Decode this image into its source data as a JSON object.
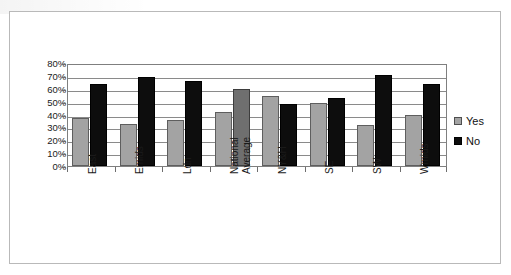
{
  "chart_data": {
    "type": "bar",
    "title": "",
    "subtitle": "",
    "xlabel": "",
    "ylabel": "",
    "ylim": [
      0,
      80
    ],
    "y_tick_labels": [
      "0%",
      "10%",
      "20%",
      "30%",
      "40%",
      "50%",
      "60%",
      "70%",
      "80%"
    ],
    "y_tick_values": [
      0,
      10,
      20,
      30,
      40,
      50,
      60,
      70,
      80
    ],
    "grid": true,
    "grid_axis": "y",
    "legend_position": "right",
    "categories": [
      "East",
      "Emids",
      "Ldn",
      "National Average",
      "NY&H",
      "SE",
      "SW",
      "Wmids"
    ],
    "series": [
      {
        "name": "Yes",
        "color": "#a3a3a3",
        "values": [
          37,
          33,
          36,
          42,
          54,
          49,
          32,
          40
        ]
      },
      {
        "name": "No",
        "color": "#0d0d0d",
        "values": [
          64,
          69,
          66,
          60,
          48,
          53,
          71,
          64
        ]
      }
    ]
  },
  "legend": {
    "entries": [
      {
        "label": "Yes",
        "swatch": "gray-square-swatch"
      },
      {
        "label": "No",
        "swatch": "black-square-swatch"
      }
    ]
  },
  "axis": {
    "y_labels": [
      "80%",
      "70%",
      "60%",
      "50%",
      "40%",
      "30%",
      "20%",
      "10%",
      "0%"
    ],
    "x_labels": [
      {
        "line1": "East",
        "line2": ""
      },
      {
        "line1": "Emids",
        "line2": ""
      },
      {
        "line1": "Ldn",
        "line2": ""
      },
      {
        "line1": "National",
        "line2": "Average"
      },
      {
        "line1": "NY&H",
        "line2": ""
      },
      {
        "line1": "SE",
        "line2": ""
      },
      {
        "line1": "SW",
        "line2": ""
      },
      {
        "line1": "Wmids",
        "line2": ""
      }
    ]
  }
}
